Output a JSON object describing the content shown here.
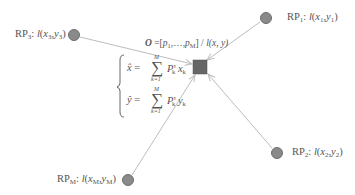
{
  "diagram": {
    "colors": {
      "node_fill": "#8a8a8a",
      "node_stroke": "#6e6e6e",
      "target_fill": "#666666",
      "edge": "#bdbdbd",
      "text": "#555555"
    },
    "nodes": [
      {
        "id": "RP1",
        "name": "RP",
        "sub": "1",
        "fn": "l",
        "args": [
          "x",
          "1",
          "y",
          "1"
        ],
        "x": 266,
        "y": 18
      },
      {
        "id": "RP2",
        "name": "RP",
        "sub": "2",
        "fn": "l",
        "args": [
          "x",
          "2",
          "y",
          "2"
        ],
        "x": 277,
        "y": 153
      },
      {
        "id": "RP3",
        "name": "RP",
        "sub": "3",
        "fn": "l",
        "args": [
          "x",
          "3",
          "y",
          "3"
        ],
        "x": 74,
        "y": 35
      },
      {
        "id": "RPM",
        "name": "RP",
        "sub": "M",
        "fn": "l",
        "args": [
          "x",
          "M",
          "y",
          "M"
        ],
        "x": 128,
        "y": 180
      }
    ],
    "target": {
      "x": 200,
      "y": 67,
      "size": 14,
      "label_bold": "O",
      "label_rest_a": " =[",
      "label_p1": "p",
      "label_p1_sub": "1",
      "label_mid": ",…,",
      "label_pM": "p",
      "label_pM_sub": "M",
      "label_end": "] / ",
      "label_fn": "l(x, y)"
    },
    "formula": {
      "x_hat": "x̂",
      "y_hat": "ŷ",
      "equals": " = ",
      "sum_symbol": "∑",
      "upper": "M",
      "lower": "k=1",
      "P": "P",
      "P_sup": "τ",
      "P_sub": "k",
      "x_var": "x",
      "y_var": "y",
      "k": "k"
    },
    "labels": {
      "rp1": "RP₁: l(x₁,y₁)",
      "rp2": "RP₂: l(x₂,y₂)",
      "rp3": "RP₃: l(x₃,y₃)",
      "rpM": "RP_M: l(x_M,y_M)"
    }
  }
}
